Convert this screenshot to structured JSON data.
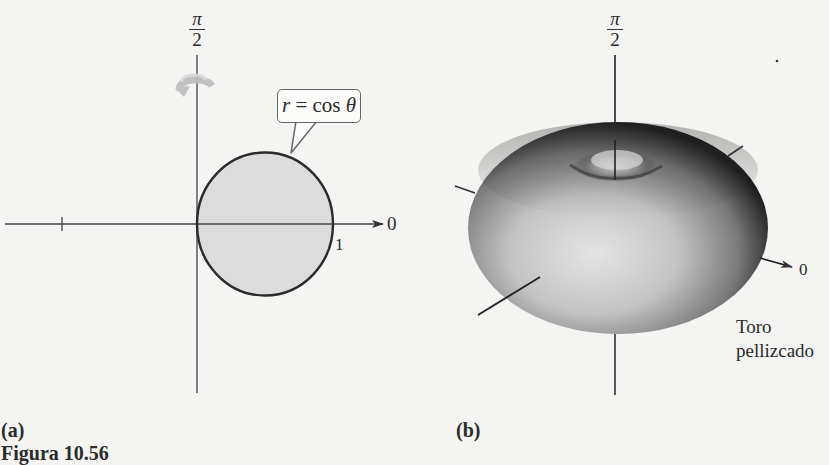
{
  "figure": {
    "caption": "Figura 10.56",
    "panels": [
      {
        "id": "a",
        "label": "(a)",
        "axis_top_label": {
          "numerator": "π",
          "denominator": "2"
        },
        "axis_right_label": "0",
        "radius_label": "1",
        "curve_callout": {
          "lhs": "r",
          "eq": " = cos ",
          "theta": "θ"
        },
        "rotation_icon": "rotate-around-axis-icon",
        "colors": {
          "circle_fill": "#dcdcdc",
          "circle_stroke": "#2a2a2a",
          "axis": "#444444",
          "rotation_icon": "#b8b8b8"
        }
      },
      {
        "id": "b",
        "label": "(b)",
        "axis_top_label": {
          "numerator": "π",
          "denominator": "2"
        },
        "axis_right_label": "0",
        "surface_label_line1": "Toro",
        "surface_label_line2": "pellizcado",
        "colors": {
          "surface_light": "#d8d8d8",
          "surface_dark": "#1e1e1e"
        }
      }
    ]
  }
}
